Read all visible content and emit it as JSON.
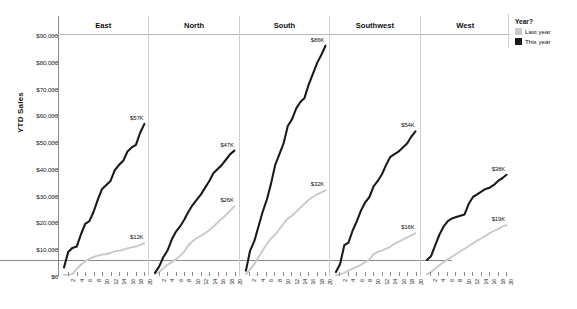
{
  "chart_data": {
    "type": "line",
    "title": "",
    "subtitle": "",
    "xlabel": "",
    "ylabel": "YTD Sales",
    "ylim": [
      0,
      90000
    ],
    "ytick_values": [
      0,
      10000,
      20000,
      30000,
      40000,
      50000,
      60000,
      70000,
      80000,
      90000
    ],
    "ytick_labels": [
      "$0",
      "$10,000",
      "$20,000",
      "$30,000",
      "$40,000",
      "$50,000",
      "$60,000",
      "$70,000",
      "$80,000",
      "$90,000"
    ],
    "grid": false,
    "xlim": [
      1,
      20
    ],
    "x": [
      1,
      2,
      3,
      4,
      5,
      6,
      7,
      8,
      9,
      10,
      11,
      12,
      13,
      14,
      15,
      16,
      17,
      18,
      19,
      20
    ],
    "xtick_values": [
      2,
      4,
      6,
      8,
      10,
      12,
      14,
      16,
      18,
      20
    ],
    "xtick_labels": [
      "2",
      "4",
      "6",
      "8",
      "10",
      "12",
      "14",
      "16",
      "18",
      "20"
    ],
    "legend": {
      "title": "Year?",
      "position": "right",
      "entries": [
        {
          "name": "Last year",
          "color": "#c9c9c9"
        },
        {
          "name": "This year",
          "color": "#1a1a1a"
        }
      ]
    },
    "facet_variable": "Region",
    "panels": [
      {
        "name": "East",
        "series": [
          {
            "name": "This year",
            "color": "#1a1a1a",
            "end_label": "$57K",
            "values": [
              3200,
              9000,
              10500,
              11000,
              15500,
              19500,
              20500,
              24000,
              28500,
              32500,
              34000,
              35500,
              39500,
              41500,
              43000,
              46500,
              48000,
              49000,
              53500,
              56800
            ]
          },
          {
            "name": "Last year",
            "color": "#c9c9c9",
            "end_label": "$12K",
            "values": [
              400,
              500,
              700,
              2600,
              4200,
              5500,
              6400,
              7100,
              7600,
              8000,
              8200,
              8600,
              9200,
              9500,
              9800,
              10300,
              10700,
              11000,
              11600,
              12200
            ]
          }
        ]
      },
      {
        "name": "North",
        "series": [
          {
            "name": "This year",
            "color": "#1a1a1a",
            "end_label": "$47K",
            "values": [
              1200,
              3500,
              7000,
              9500,
              13500,
              16500,
              18500,
              21000,
              24000,
              26500,
              28500,
              30500,
              33000,
              35500,
              38500,
              40000,
              41500,
              43500,
              45500,
              46800
            ]
          },
          {
            "name": "Last year",
            "color": "#c9c9c9",
            "end_label": "$26K",
            "values": [
              700,
              1500,
              2800,
              4200,
              5200,
              6200,
              7500,
              9200,
              11500,
              13000,
              14200,
              15000,
              16000,
              17200,
              18500,
              20000,
              21500,
              22800,
              24500,
              26000
            ]
          }
        ]
      },
      {
        "name": "South",
        "series": [
          {
            "name": "This year",
            "color": "#1a1a1a",
            "end_label": "$86K",
            "values": [
              2000,
              9500,
              13000,
              18500,
              24000,
              28500,
              34500,
              41500,
              45500,
              49500,
              56000,
              58500,
              62500,
              65000,
              66500,
              71500,
              75500,
              79500,
              82500,
              86000
            ]
          },
          {
            "name": "Last year",
            "color": "#c9c9c9",
            "end_label": "$32K",
            "values": [
              600,
              2500,
              4500,
              7000,
              9500,
              12000,
              14000,
              15500,
              17500,
              19500,
              21500,
              22500,
              24000,
              25500,
              27000,
              28500,
              29500,
              30500,
              31200,
              32000
            ]
          }
        ]
      },
      {
        "name": "Southwest",
        "series": [
          {
            "name": "This year",
            "color": "#1a1a1a",
            "end_label": "$54K",
            "values": [
              1500,
              4500,
              11500,
              12500,
              17000,
              20500,
              24500,
              27500,
              29500,
              33500,
              35500,
              38000,
              41500,
              44500,
              45500,
              46500,
              48000,
              49500,
              52000,
              54000
            ]
          },
          {
            "name": "Last year",
            "color": "#c9c9c9",
            "end_label": "$16K",
            "values": [
              200,
              600,
              1200,
              2000,
              2800,
              3400,
              4200,
              5200,
              6200,
              8200,
              9000,
              9500,
              10200,
              11000,
              12000,
              12800,
              13600,
              14400,
              15200,
              16000
            ]
          }
        ]
      },
      {
        "name": "West",
        "series": [
          {
            "name": "This year",
            "color": "#1a1a1a",
            "end_label": "$38K",
            "values": [
              6000,
              7500,
              11500,
              15500,
              18500,
              20500,
              21500,
              22000,
              22500,
              23000,
              27000,
              29500,
              30500,
              31500,
              32500,
              33000,
              34000,
              35500,
              36500,
              37800
            ]
          },
          {
            "name": "Last year",
            "color": "#c9c9c9",
            "end_label": "$19K",
            "values": [
              600,
              1500,
              2800,
              4000,
              5200,
              6200,
              7200,
              8200,
              9200,
              10200,
              11200,
              12200,
              13200,
              14000,
              15000,
              16000,
              16800,
              17600,
              18400,
              19000
            ]
          }
        ]
      }
    ]
  }
}
